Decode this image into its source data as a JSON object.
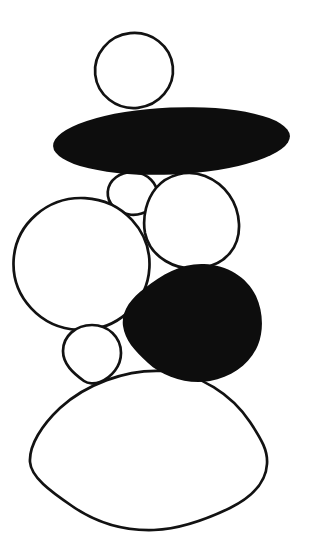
{
  "illustration": {
    "background_color": "#ffffff",
    "outline_color": "#121212",
    "black_fill": "#0d0d0d",
    "white_fill": "#ffffff",
    "outline_width": 2.7,
    "canvas": {
      "width": 322,
      "height": 549
    },
    "stones": [
      {
        "name": "top-round-stone",
        "kind": "ellipse",
        "fill": "#ffffff",
        "stroked": true,
        "cx": 134,
        "cy": 70.5,
        "rx": 39,
        "ry": 37.5,
        "rotate": -6
      },
      {
        "name": "small-stone-below-slab",
        "kind": "ellipse",
        "fill": "#ffffff",
        "stroked": true,
        "cx": 132.5,
        "cy": 193.5,
        "rx": 24.8,
        "ry": 21.3,
        "rotate": 4
      },
      {
        "name": "mid-right-stone",
        "kind": "path",
        "fill": "#ffffff",
        "stroked": true,
        "d": "M 156 188 C 167 175, 187 169, 205 176 C 225 184, 238 202, 239 224 C 240 247, 226 264, 202 268 C 176 272, 150 257, 145 233 C 142 216, 147 199, 156 188 Z"
      },
      {
        "name": "black-slab-stone",
        "kind": "ellipse",
        "fill": "#0d0d0d",
        "stroked": false,
        "cx": 171.5,
        "cy": 141,
        "rx": 118.5,
        "ry": 33.5,
        "rotate": -2.5
      },
      {
        "name": "large-left-stone",
        "kind": "ellipse",
        "fill": "#ffffff",
        "stroked": true,
        "cx": 81.5,
        "cy": 264,
        "rx": 68,
        "ry": 66,
        "rotate": 3
      },
      {
        "name": "small-left-stone",
        "kind": "path",
        "fill": "#ffffff",
        "stroked": true,
        "d": "M 92 325 C 108 325, 121 337, 121 353 C 121 366, 112 377, 100 382 C 95 384, 88 384, 84 381 C 73 373, 63 364, 63 351 C 63 336, 76 325, 92 325 Z"
      },
      {
        "name": "base-stone",
        "kind": "path",
        "fill": "#ffffff",
        "stroked": true,
        "d": "M 163 371 C 200 373, 232 395, 250 422 C 262 440, 268 451, 267 464 C 266 482, 252 497, 230 508 C 205 520, 180 529, 154 530 C 124 531, 95 522, 72 506 C 50 491, 31 477, 30 462 C 29 445, 42 425, 60 408 C 85 385, 125 369, 163 371 Z"
      },
      {
        "name": "black-boulder-stone",
        "kind": "path",
        "fill": "#0d0d0d",
        "stroked": false,
        "d": "M 123 326 C 121 312, 130 299, 145 288 C 162 274, 183 263, 204 264 C 227 265, 247 277, 256 296 C 263 311, 264 330, 258 345 C 250 364, 232 377, 210 381 C 188 385, 163 377, 148 363 C 134 350, 125 340, 123 326 Z"
      }
    ]
  }
}
